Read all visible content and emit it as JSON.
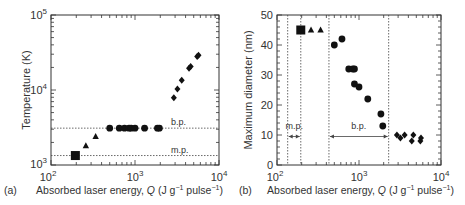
{
  "chart_data": [
    {
      "panel": "(a)",
      "type": "scatter",
      "title": "",
      "xlabel": "Absorbed laser energy, Q (J g⁻¹ pulse⁻¹)",
      "ylabel": "Temperature (K)",
      "xscale": "log",
      "yscale": "log",
      "xlim": [
        100,
        10000
      ],
      "ylim": [
        1000,
        100000
      ],
      "xticks": [
        "10^2",
        "10^3",
        "10^4"
      ],
      "yticks": [
        "10^3",
        "10^4",
        "10^5"
      ],
      "grid": false,
      "reference_lines": [
        {
          "label": "b.p.",
          "y": 3100,
          "style": "dotted"
        },
        {
          "label": "m.p.",
          "y": 1337,
          "style": "dotted"
        }
      ],
      "series": [
        {
          "name": "square",
          "marker": "square",
          "points": [
            [
              195,
              1337
            ]
          ]
        },
        {
          "name": "triangle",
          "marker": "triangle",
          "points": [
            [
              260,
              1800
            ],
            [
              340,
              2400
            ]
          ]
        },
        {
          "name": "circle",
          "marker": "circle",
          "points": [
            [
              500,
              3100
            ],
            [
              650,
              3100
            ],
            [
              750,
              3100
            ],
            [
              850,
              3100
            ],
            [
              900,
              3100
            ],
            [
              1000,
              3100
            ],
            [
              1300,
              3100
            ],
            [
              1850,
              3100
            ],
            [
              1950,
              3100
            ]
          ]
        },
        {
          "name": "diamond",
          "marker": "diamond",
          "points": [
            [
              2900,
              7900
            ],
            [
              3200,
              10300
            ],
            [
              3600,
              13500
            ],
            [
              4400,
              19500
            ],
            [
              4600,
              20500
            ],
            [
              5500,
              28000
            ],
            [
              5700,
              29000
            ]
          ]
        }
      ]
    },
    {
      "panel": "(b)",
      "type": "scatter",
      "title": "",
      "xlabel": "Absorbed laser energy, Q (J g⁻¹ pulse⁻¹)",
      "ylabel": "Maximum diameter (nm)",
      "xscale": "log",
      "yscale": "linear",
      "xlim": [
        100,
        10000
      ],
      "ylim": [
        0,
        50
      ],
      "xticks": [
        "10^2",
        "10^3",
        "10^4"
      ],
      "yticks": [
        0,
        10,
        20,
        30,
        40,
        50
      ],
      "grid": false,
      "vertical_lines": [
        135,
        195,
        430,
        2300
      ],
      "annotations": [
        {
          "label": "m.p.",
          "from": 135,
          "to": 195,
          "y": 9.5
        },
        {
          "label": "b.p.",
          "from": 430,
          "to": 2300,
          "y": 9.5
        }
      ],
      "series": [
        {
          "name": "square",
          "marker": "square",
          "points": [
            [
              195,
              45
            ]
          ]
        },
        {
          "name": "triangle",
          "marker": "triangle",
          "points": [
            [
              260,
              45
            ],
            [
              340,
              45
            ]
          ]
        },
        {
          "name": "circle",
          "marker": "circle",
          "points": [
            [
              500,
              40
            ],
            [
              620,
              42
            ],
            [
              750,
              32
            ],
            [
              840,
              32
            ],
            [
              880,
              32
            ],
            [
              880,
              27
            ],
            [
              1000,
              26
            ],
            [
              1280,
              22
            ],
            [
              1850,
              17
            ],
            [
              1950,
              13
            ]
          ]
        },
        {
          "name": "diamond",
          "marker": "diamond",
          "points": [
            [
              2900,
              10
            ],
            [
              3200,
              9
            ],
            [
              3600,
              10
            ],
            [
              4400,
              8
            ],
            [
              4600,
              10
            ],
            [
              5600,
              8
            ],
            [
              5700,
              9
            ]
          ]
        }
      ]
    }
  ],
  "captions": {
    "a_label": "(a)",
    "b_label": "(b)",
    "xlabel_prefix": "Absorbed laser energy, ",
    "xlabel_var": "Q",
    "xlabel_unit": " (J g",
    "sup1": "−1",
    "xlabel_unit2": " pulse",
    "sup2": "−1",
    "xlabel_close": ")",
    "ylabel_a": "Temperature (K)",
    "ylabel_b": "Maximum diameter (nm)"
  }
}
